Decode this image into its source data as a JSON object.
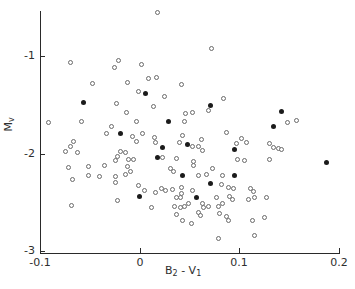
{
  "figure": {
    "background": "#ffffff",
    "axis_color": "#2a2a2a",
    "open_marker_color": "#6a6a6a",
    "filled_marker_color": "#1b1b1b"
  },
  "axes": {
    "x": {
      "label_base_1": "B",
      "label_sub_1": "2",
      "label_sep": " - ",
      "label_base_2": "V",
      "label_sub_2": "1",
      "ticks": [
        "-0.1",
        "0",
        "0.1",
        "0.2"
      ]
    },
    "y": {
      "label_base": "M",
      "label_sub": "v",
      "ticks": [
        "-1",
        "-2",
        "-3"
      ]
    }
  },
  "chart_data": {
    "type": "scatter",
    "title": "",
    "xlabel": "B2 - V1",
    "ylabel": "Mv",
    "xlim": [
      -0.1,
      0.2
    ],
    "ylim": [
      -3,
      -0.55
    ],
    "xticks": [
      -0.1,
      0,
      0.1,
      0.2
    ],
    "yticks": [
      -1,
      -2,
      -3
    ],
    "grid": false,
    "legend": "none",
    "series": [
      {
        "name": "open circles",
        "marker": "open-circle",
        "points": [
          [
            -0.069,
            -1.07
          ],
          [
            -0.021,
            -1.05
          ],
          [
            -0.025,
            -1.12
          ],
          [
            -0.047,
            -1.28
          ],
          [
            -0.012,
            -1.27
          ],
          [
            0.002,
            -1.09
          ],
          [
            0.018,
            -0.55
          ],
          [
            0.072,
            -0.92
          ],
          [
            0.009,
            -1.23
          ],
          [
            0.017,
            -1.22
          ],
          [
            0.042,
            -1.29
          ],
          [
            -0.001,
            -1.36
          ],
          [
            -0.023,
            -1.49
          ],
          [
            -0.092,
            -1.68
          ],
          [
            -0.058,
            -1.67
          ],
          [
            -0.013,
            -1.58
          ],
          [
            -0.003,
            -1.67
          ],
          [
            -0.028,
            -1.72
          ],
          [
            -0.033,
            -1.79
          ],
          [
            -0.007,
            -1.83
          ],
          [
            -0.003,
            -1.88
          ],
          [
            -0.066,
            -1.88
          ],
          [
            -0.069,
            -1.93
          ],
          [
            -0.074,
            -1.98
          ],
          [
            -0.062,
            -1.99
          ],
          [
            -0.019,
            -1.98
          ],
          [
            -0.022,
            -2.03
          ],
          [
            -0.024,
            -2.07
          ],
          [
            -0.014,
            -1.99
          ],
          [
            -0.011,
            -2.06
          ],
          [
            -0.006,
            -2.06
          ],
          [
            -0.051,
            -2.13
          ],
          [
            -0.035,
            -2.12
          ],
          [
            -0.071,
            -2.14
          ],
          [
            -0.012,
            -2.13
          ],
          [
            -0.009,
            -2.18
          ],
          [
            -0.014,
            -2.21
          ],
          [
            -0.051,
            -2.23
          ],
          [
            -0.04,
            -2.24
          ],
          [
            -0.067,
            -2.27
          ],
          [
            -0.024,
            -2.24
          ],
          [
            -0.024,
            -2.3
          ],
          [
            -0.001,
            -2.33
          ],
          [
            -0.022,
            -2.48
          ],
          [
            -0.068,
            -2.53
          ],
          [
            0.025,
            -1.42
          ],
          [
            0.084,
            -1.44
          ],
          [
            0.069,
            -1.56
          ],
          [
            0.014,
            -1.52
          ],
          [
            0.046,
            -1.59
          ],
          [
            0.053,
            -1.58
          ],
          [
            0.045,
            -1.67
          ],
          [
            0.087,
            -1.78
          ],
          [
            0.003,
            -1.79
          ],
          [
            0.015,
            -1.84
          ],
          [
            0.016,
            -1.89
          ],
          [
            0.043,
            -1.81
          ],
          [
            0.062,
            -1.86
          ],
          [
            0.04,
            -1.89
          ],
          [
            0.053,
            -1.93
          ],
          [
            0.059,
            -1.93
          ],
          [
            0.063,
            -1.97
          ],
          [
            0.097,
            -1.9
          ],
          [
            0.023,
            -2.04
          ],
          [
            0.037,
            -2.05
          ],
          [
            0.054,
            -2.08
          ],
          [
            0.098,
            -2.06
          ],
          [
            0.148,
            -1.68
          ],
          [
            0.157,
            -1.66
          ],
          [
            0.102,
            -1.85
          ],
          [
            0.107,
            -1.89
          ],
          [
            0.13,
            -1.9
          ],
          [
            0.134,
            -1.94
          ],
          [
            0.139,
            -1.95
          ],
          [
            0.142,
            -1.96
          ],
          [
            0.105,
            -2.07
          ],
          [
            0.13,
            -2.06
          ],
          [
            0.031,
            -2.15
          ],
          [
            0.034,
            -2.18
          ],
          [
            0.054,
            -2.12
          ],
          [
            0.073,
            -2.15
          ],
          [
            0.067,
            -2.21
          ],
          [
            0.059,
            -2.23
          ],
          [
            0.083,
            -2.23
          ],
          [
            0.082,
            -2.32
          ],
          [
            0.089,
            -2.35
          ],
          [
            0.094,
            -2.36
          ],
          [
            0.005,
            -2.38
          ],
          [
            0.016,
            -2.4
          ],
          [
            0.022,
            -2.36
          ],
          [
            0.026,
            -2.38
          ],
          [
            0.033,
            -2.37
          ],
          [
            0.042,
            -2.35
          ],
          [
            0.042,
            -2.41
          ],
          [
            0.037,
            -2.45
          ],
          [
            0.041,
            -2.45
          ],
          [
            0.053,
            -2.38
          ],
          [
            0.077,
            -2.45
          ],
          [
            0.09,
            -2.44
          ],
          [
            0.093,
            -2.47
          ],
          [
            0.012,
            -2.55
          ],
          [
            0.035,
            -2.54
          ],
          [
            0.041,
            -2.55
          ],
          [
            0.045,
            -2.54
          ],
          [
            0.049,
            -2.51
          ],
          [
            0.063,
            -2.51
          ],
          [
            0.064,
            -2.55
          ],
          [
            0.069,
            -2.54
          ],
          [
            0.079,
            -2.54
          ],
          [
            0.083,
            -2.51
          ],
          [
            0.037,
            -2.63
          ],
          [
            0.059,
            -2.6
          ],
          [
            0.061,
            -2.64
          ],
          [
            0.08,
            -2.61
          ],
          [
            0.087,
            -2.65
          ],
          [
            0.089,
            -2.69
          ],
          [
            0.043,
            -2.69
          ],
          [
            0.052,
            -2.72
          ],
          [
            0.079,
            -2.87
          ],
          [
            0.111,
            -2.36
          ],
          [
            0.114,
            -2.39
          ],
          [
            0.109,
            -2.47
          ],
          [
            0.115,
            -2.45
          ],
          [
            0.127,
            -2.45
          ],
          [
            0.113,
            -2.69
          ],
          [
            0.125,
            -2.66
          ],
          [
            0.115,
            -2.84
          ]
        ]
      },
      {
        "name": "filled circles",
        "marker": "filled-circle",
        "points": [
          [
            -0.056,
            -1.48
          ],
          [
            -0.019,
            -1.79
          ],
          [
            0.0,
            -2.44
          ],
          [
            0.006,
            -1.38
          ],
          [
            0.071,
            -1.51
          ],
          [
            0.029,
            -1.67
          ],
          [
            0.023,
            -1.94
          ],
          [
            0.048,
            -1.91
          ],
          [
            0.095,
            -1.96
          ],
          [
            0.018,
            -2.04
          ],
          [
            0.142,
            -1.57
          ],
          [
            0.134,
            -1.72
          ],
          [
            0.187,
            -2.09
          ],
          [
            0.043,
            -2.23
          ],
          [
            0.095,
            -2.22
          ],
          [
            0.071,
            -2.31
          ],
          [
            0.057,
            -2.45
          ]
        ]
      }
    ]
  }
}
